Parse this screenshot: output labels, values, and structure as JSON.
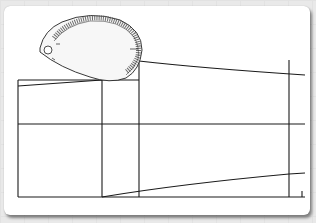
{
  "diagram": {
    "colors": {
      "background": "#e9e9e9",
      "card": "#ffffff",
      "line": "#1a1a1a",
      "ruler_fill": "#f4f4f4",
      "ruler_ticks": "#333333"
    },
    "elements": [
      "french-curve-ruler",
      "draft-frame",
      "sleeve-cap-curve",
      "hem-curve",
      "grain-lines"
    ]
  }
}
